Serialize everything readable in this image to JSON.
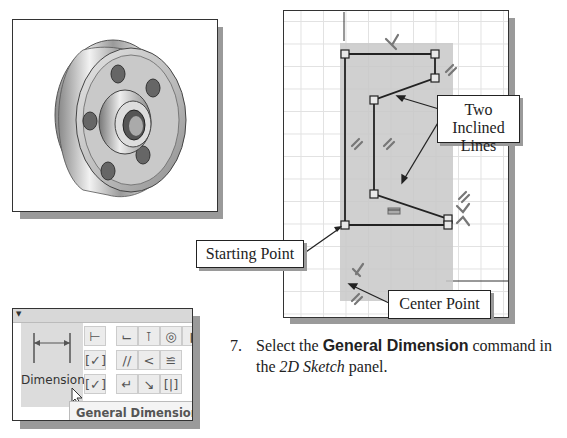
{
  "figure_part_image": {
    "alt": "3D flywheel part with four bolt holes and central hub"
  },
  "sketch_window": {
    "callouts": {
      "inclined_lines": {
        "line1": "Two Inclined",
        "line2": "Lines"
      },
      "starting_point": "Starting Point",
      "center_point": "Center Point"
    },
    "constraint_glyphs": [
      "perpendicular",
      "parallel",
      "parallel",
      "parallel",
      "horizontal",
      "parallel",
      "perpendicular",
      "perpendicular",
      "parallel"
    ]
  },
  "toolbar": {
    "big_button_label": "Dimension",
    "tooltip_label": "General Dimension",
    "tooltip_shortcut": "(D)",
    "small_icons": [
      "auto-dimension",
      "show-constraints",
      "show-constraints-2",
      "perpendicular",
      "coincident",
      "concentric",
      "parallel",
      "tangent",
      "horizontal",
      "fix",
      "symmetric",
      "smooth"
    ]
  },
  "instruction": {
    "number": "7.",
    "prefix": "Select the ",
    "bold": "General Dimension",
    "middle": " command in the ",
    "italic1": "2D",
    "italic2": "Sketch",
    "suffix": " panel."
  }
}
